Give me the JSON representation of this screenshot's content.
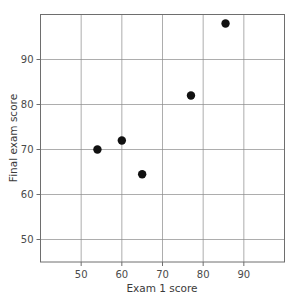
{
  "top_strip": {
    "text": "",
    "note": "clipped partial line of text at image top edge"
  },
  "chart_data": {
    "type": "scatter",
    "title": "",
    "xlabel": "Exam 1 score",
    "ylabel": "Final exam score",
    "xlim": [
      40,
      100
    ],
    "ylim": [
      45,
      100
    ],
    "xticks": [
      50,
      60,
      70,
      80,
      90
    ],
    "yticks": [
      50,
      60,
      70,
      80,
      90
    ],
    "xtick_labels": [
      "50",
      "60",
      "70",
      "80",
      "90"
    ],
    "ytick_labels": [
      "50",
      "60",
      "70",
      "80",
      "90"
    ],
    "grid": true,
    "legend": false,
    "marker": {
      "shape": "circle",
      "color": "#111111",
      "size": 4.2
    },
    "series": [
      {
        "name": "students",
        "points": [
          {
            "x": 54,
            "y": 70
          },
          {
            "x": 60,
            "y": 72
          },
          {
            "x": 65,
            "y": 64.5
          },
          {
            "x": 77,
            "y": 82
          },
          {
            "x": 85.5,
            "y": 98
          }
        ]
      }
    ],
    "x": [
      54,
      60,
      65,
      77,
      85.5
    ],
    "y": [
      70,
      72,
      64.5,
      82,
      98
    ],
    "colors": {
      "marker": "#111111",
      "frame": "#6e6e6e",
      "grid": "#8a8a8a",
      "text": "#3a3a3a",
      "background": "#ffffff"
    }
  }
}
